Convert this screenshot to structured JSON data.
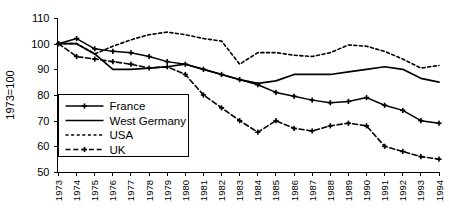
{
  "chart_data": {
    "type": "line",
    "title": "",
    "xlabel": "",
    "ylabel": "1973=100",
    "ylim": [
      50,
      110
    ],
    "ytick_step": 10,
    "yticks": [
      50,
      60,
      70,
      80,
      90,
      100,
      110
    ],
    "grid": false,
    "legend_position": "inside-left-lower",
    "x_label_rotation": -90,
    "categories": [
      "1973",
      "1974",
      "1975",
      "1976",
      "1977",
      "1978",
      "1979",
      "1980",
      "1981",
      "1982",
      "1983",
      "1984",
      "1985",
      "1986",
      "1987",
      "1988",
      "1989",
      "1990",
      "1991",
      "1992",
      "1993",
      "1994"
    ],
    "series": [
      {
        "name": "France",
        "style": "solid-marker",
        "marker": "cross",
        "color": "#000000",
        "values": [
          100,
          102,
          98,
          97,
          96.5,
          95,
          93,
          92,
          90,
          88,
          86,
          84,
          81,
          79.5,
          78,
          77,
          77.5,
          79,
          76,
          74,
          70,
          69
        ]
      },
      {
        "name": "West Germany",
        "style": "solid",
        "marker": "none",
        "color": "#000000",
        "values": [
          100,
          100,
          96,
          90,
          90,
          90.5,
          91,
          92,
          90,
          88,
          86,
          84.5,
          85.5,
          88,
          88,
          88,
          89,
          90,
          91,
          90,
          86.5,
          85
        ]
      },
      {
        "name": "USA",
        "style": "dotted",
        "marker": "none",
        "color": "#000000",
        "values": [
          100,
          100,
          96,
          99,
          101.5,
          103.5,
          104.5,
          103.5,
          102,
          101,
          92,
          96.5,
          96.5,
          95.5,
          95,
          96.5,
          99.5,
          99,
          97,
          94,
          90.5,
          91.5
        ]
      },
      {
        "name": "UK",
        "style": "dashed-marker",
        "marker": "cross",
        "color": "#000000",
        "values": [
          100,
          95,
          94,
          93,
          92,
          90.5,
          91,
          88,
          80,
          75,
          70,
          65.5,
          70,
          67,
          66,
          68,
          69,
          68,
          60,
          58,
          56,
          55
        ]
      }
    ]
  },
  "legend": {
    "entries": [
      {
        "label": "France"
      },
      {
        "label": "West Germany"
      },
      {
        "label": "USA"
      },
      {
        "label": "UK"
      }
    ]
  }
}
